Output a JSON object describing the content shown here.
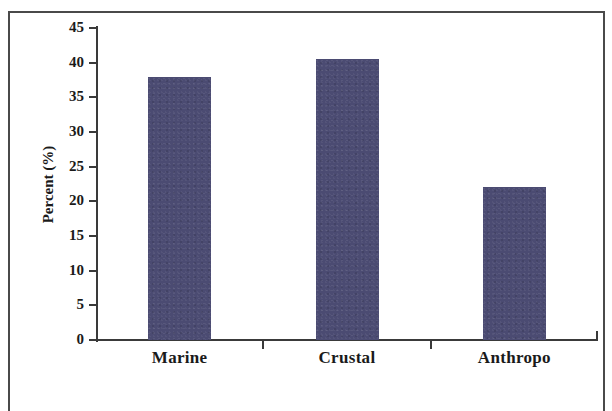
{
  "chart_data": {
    "type": "bar",
    "title": "",
    "xlabel": "",
    "ylabel": "Percent (%)",
    "categories": [
      "Marine",
      "Crustal",
      "Anthropo"
    ],
    "values": [
      38,
      40.5,
      22
    ],
    "series": [
      {
        "name": "Percent",
        "values": [
          38,
          40.5,
          22
        ]
      }
    ],
    "ylim": [
      0,
      45
    ],
    "yticks": [
      0,
      5,
      10,
      15,
      20,
      25,
      30,
      35,
      40,
      45
    ],
    "ytick_labels": [
      "0",
      "5",
      "10",
      "15",
      "20",
      "25",
      "30",
      "35",
      "40",
      "45"
    ],
    "grid": false,
    "legend": false,
    "legend_position": "none",
    "bar_color": "#4b4b72",
    "axis_color": "#3a3a3a",
    "frame_color": "#4a4a4a",
    "background_color": "#ffffff"
  }
}
